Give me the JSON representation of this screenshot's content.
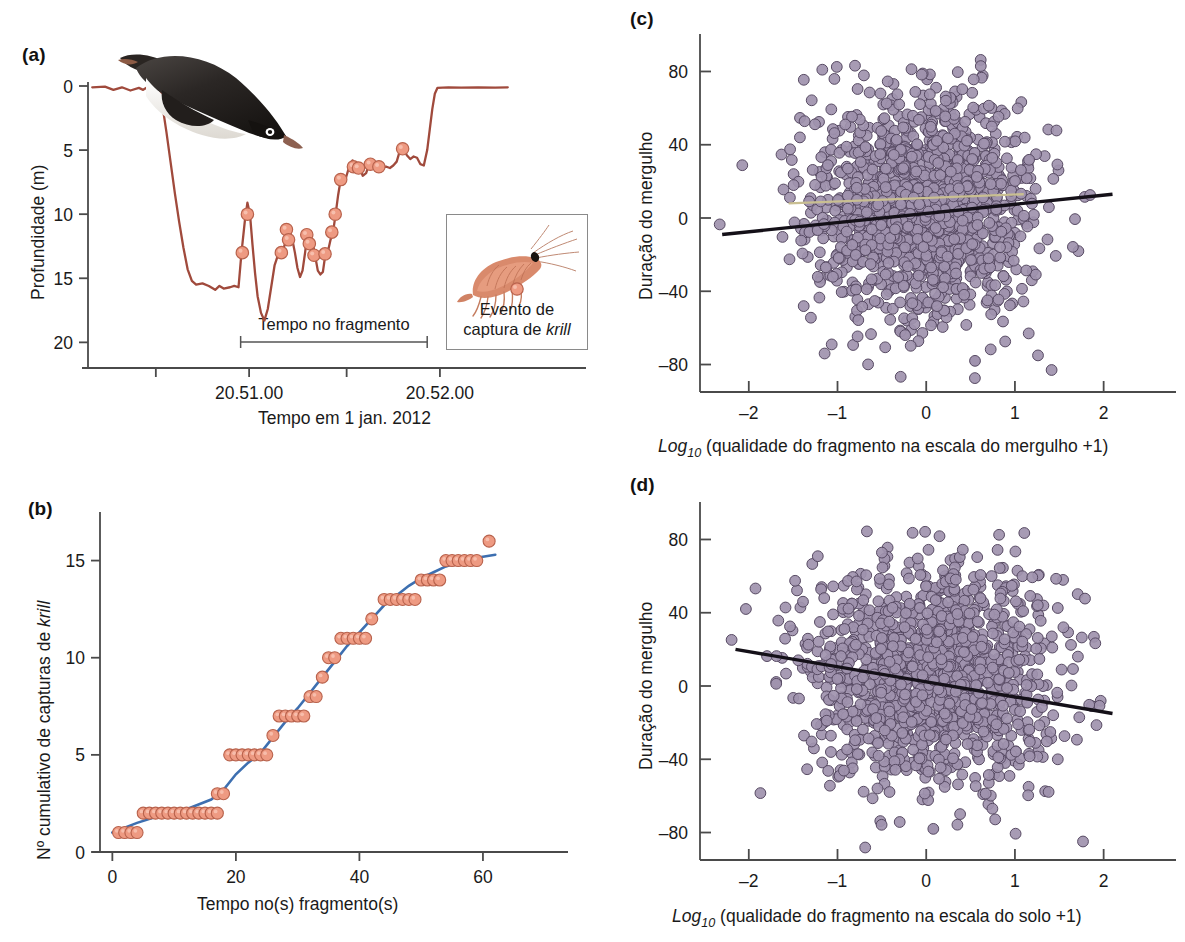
{
  "figure": {
    "panels": [
      "a",
      "b",
      "c",
      "d"
    ],
    "colors": {
      "dive_trace": "#a04a3c",
      "krill_marker_fill": "#ee9a82",
      "krill_marker_edge": "#b8624c",
      "fit_curve_blue": "#3d6fb0",
      "scatter_fill": "#a093ae",
      "scatter_edge": "#574a63",
      "regression_line": "#141018",
      "axis": "#4a4a4a",
      "text": "#1a1a1a"
    }
  },
  "panel_a": {
    "label": "(a)",
    "ylabel": "Profundidade (m)",
    "xlabel": "Tempo em 1 jan. 2012",
    "bracket_label": "Tempo no fragmento",
    "yticks": [
      0,
      5,
      10,
      15,
      20
    ],
    "xticks": [
      "",
      "20.51.00",
      "",
      "20.52.00"
    ],
    "legend": {
      "line1": "Evento de",
      "line2_prefix": "captura de ",
      "line2_italic": "krill",
      "marker": "krill-capture-dot",
      "icon": "krill-illustration"
    },
    "animal_icon": "penguin-illustration"
  },
  "panel_b": {
    "label": "(b)",
    "ylabel_prefix": "Nº cumulativo de capturas de ",
    "ylabel_italic": "krill",
    "xlabel": "Tempo no(s) fragmento(s)",
    "yticks": [
      0,
      5,
      10,
      15
    ],
    "xticks": [
      0,
      20,
      40,
      60
    ]
  },
  "panel_c": {
    "label": "(c)",
    "ylabel": "Duração do mergulho",
    "xlabel_prefix": "Log",
    "xlabel_sub": "10",
    "xlabel_rest": " (qualidade do fragmento na escala do mergulho +1)",
    "yticks": [
      "80",
      "40",
      "0",
      "–40",
      "–80"
    ],
    "xticks": [
      "–2",
      "–1",
      "0",
      "1",
      "2"
    ]
  },
  "panel_d": {
    "label": "(d)",
    "ylabel": "Duração do mergulho",
    "xlabel_prefix": "Log",
    "xlabel_sub": "10",
    "xlabel_rest": " (qualidade do fragmento na escala do solo +1)",
    "yticks": [
      "80",
      "40",
      "0",
      "–40",
      "–80"
    ],
    "xticks": [
      "–2",
      "–1",
      "0",
      "1",
      "2"
    ]
  },
  "chart_data": [
    {
      "panel": "a",
      "type": "line",
      "title": "",
      "xlabel": "Tempo em 1 jan. 2012",
      "ylabel": "Profundidade (m)",
      "ylim": [
        0,
        22
      ],
      "y_inverted": true,
      "xlim": [
        0,
        100
      ],
      "xtick_positions": [
        16,
        38,
        61,
        83
      ],
      "xtick_labels": [
        "",
        "20.51.00",
        "",
        "20.52.00"
      ],
      "ytick_values": [
        0,
        5,
        10,
        15,
        20
      ],
      "grid": false,
      "bracket": {
        "label": "Tempo no fragmento",
        "x_start": 36,
        "x_end": 80
      },
      "dive_profile": [
        [
          1,
          0.1
        ],
        [
          4,
          0.05
        ],
        [
          6,
          0.3
        ],
        [
          8,
          0.1
        ],
        [
          10,
          0.35
        ],
        [
          12,
          0.15
        ],
        [
          13,
          0.3
        ],
        [
          14,
          0.1
        ],
        [
          15,
          0.25
        ],
        [
          16,
          0.1
        ],
        [
          16.5,
          0.2
        ],
        [
          17,
          0.1
        ],
        [
          17.5,
          1.4
        ],
        [
          18.5,
          3.6
        ],
        [
          19.5,
          6.0
        ],
        [
          20.5,
          8.4
        ],
        [
          21.5,
          10.6
        ],
        [
          22.5,
          12.6
        ],
        [
          23.5,
          14.3
        ],
        [
          24.5,
          15.2
        ],
        [
          25.5,
          15.5
        ],
        [
          27,
          15.4
        ],
        [
          28.5,
          15.6
        ],
        [
          30,
          15.9
        ],
        [
          31,
          15.6
        ],
        [
          32,
          15.8
        ],
        [
          33.5,
          15.7
        ],
        [
          34.5,
          15.6
        ],
        [
          35.5,
          15.7
        ],
        [
          36.2,
          13.0
        ],
        [
          37,
          10.5
        ],
        [
          37.6,
          9.1
        ],
        [
          38.2,
          10.0
        ],
        [
          38.8,
          12.4
        ],
        [
          39.4,
          14.6
        ],
        [
          40,
          16.4
        ],
        [
          40.8,
          17.7
        ],
        [
          41.6,
          18.3
        ],
        [
          42.4,
          17.4
        ],
        [
          43.2,
          15.7
        ],
        [
          44,
          14.0
        ],
        [
          44.8,
          13.2
        ],
        [
          45.6,
          13.0
        ],
        [
          46.4,
          12.4
        ],
        [
          47,
          11.0
        ],
        [
          47.6,
          11.3
        ],
        [
          48.2,
          12.0
        ],
        [
          48.8,
          13.0
        ],
        [
          49.4,
          14.2
        ],
        [
          50,
          14.9
        ],
        [
          50.6,
          14.4
        ],
        [
          51.2,
          13.0
        ],
        [
          51.8,
          11.4
        ],
        [
          52.4,
          11.8
        ],
        [
          53,
          12.2
        ],
        [
          53.6,
          13.3
        ],
        [
          54.2,
          14.4
        ],
        [
          54.8,
          14.7
        ],
        [
          55.4,
          14.5
        ],
        [
          56,
          13.1
        ],
        [
          56.6,
          12.9
        ],
        [
          57.2,
          12.0
        ],
        [
          57.8,
          11.4
        ],
        [
          58.4,
          10.0
        ],
        [
          59,
          8.5
        ],
        [
          59.6,
          7.3
        ],
        [
          60.2,
          7.1
        ],
        [
          60.8,
          7.2
        ],
        [
          61.6,
          6.3
        ],
        [
          62.4,
          5.8
        ],
        [
          63.2,
          6.2
        ],
        [
          64,
          6.3
        ],
        [
          64.8,
          7.0
        ],
        [
          65.6,
          6.8
        ],
        [
          66.4,
          6.0
        ],
        [
          67.2,
          6.2
        ],
        [
          68,
          6.3
        ],
        [
          68.8,
          6.5
        ],
        [
          69.6,
          6.3
        ],
        [
          70.4,
          6.3
        ],
        [
          71.2,
          6.4
        ],
        [
          72,
          6.2
        ],
        [
          72.8,
          5.9
        ],
        [
          73.6,
          5.0
        ],
        [
          74.4,
          4.9
        ],
        [
          75.2,
          5.4
        ],
        [
          76,
          5.7
        ],
        [
          76.8,
          5.5
        ],
        [
          77.6,
          5.6
        ],
        [
          78.4,
          6.1
        ],
        [
          79.2,
          6.2
        ],
        [
          80,
          5.0
        ],
        [
          80.6,
          3.4
        ],
        [
          81.2,
          1.8
        ],
        [
          81.8,
          0.6
        ],
        [
          82.4,
          0.15
        ],
        [
          85,
          0.1
        ],
        [
          88,
          0.12
        ],
        [
          92,
          0.1
        ],
        [
          96,
          0.12
        ],
        [
          99,
          0.1
        ]
      ],
      "krill_events": [
        [
          36.4,
          13.0
        ],
        [
          37.6,
          10.0
        ],
        [
          46.8,
          11.2
        ],
        [
          47.3,
          12.0
        ],
        [
          45.6,
          13.0
        ],
        [
          51.6,
          11.6
        ],
        [
          52.2,
          12.3
        ],
        [
          53.3,
          13.2
        ],
        [
          57.5,
          11.4
        ],
        [
          58.3,
          10.0
        ],
        [
          55.9,
          13.1
        ],
        [
          59.6,
          7.3
        ],
        [
          62.6,
          6.3
        ],
        [
          63.8,
          6.4
        ],
        [
          66.6,
          6.1
        ],
        [
          68.6,
          6.3
        ],
        [
          74.2,
          4.9
        ]
      ]
    },
    {
      "panel": "b",
      "type": "scatter",
      "title": "",
      "xlabel": "Tempo no(s) fragmento(s)",
      "ylabel": "Nº cumulativo de capturas de krill",
      "xlim": [
        -2,
        66
      ],
      "ylim": [
        0,
        17.5
      ],
      "xticks": [
        0,
        20,
        40,
        60
      ],
      "yticks": [
        0,
        5,
        10,
        15
      ],
      "grid": false,
      "points": [
        [
          1,
          1
        ],
        [
          2,
          1
        ],
        [
          3,
          1
        ],
        [
          4,
          1
        ],
        [
          5,
          2
        ],
        [
          6,
          2
        ],
        [
          7,
          2
        ],
        [
          8,
          2
        ],
        [
          9,
          2
        ],
        [
          10,
          2
        ],
        [
          11,
          2
        ],
        [
          12,
          2
        ],
        [
          13,
          2
        ],
        [
          14,
          2
        ],
        [
          15,
          2
        ],
        [
          16,
          2
        ],
        [
          17,
          2
        ],
        [
          17,
          3
        ],
        [
          18,
          3
        ],
        [
          19,
          5
        ],
        [
          20,
          5
        ],
        [
          21,
          5
        ],
        [
          22,
          5
        ],
        [
          23,
          5
        ],
        [
          24,
          5
        ],
        [
          25,
          5
        ],
        [
          26,
          6
        ],
        [
          27,
          7
        ],
        [
          28,
          7
        ],
        [
          29,
          7
        ],
        [
          30,
          7
        ],
        [
          31,
          7
        ],
        [
          32,
          8
        ],
        [
          33,
          8
        ],
        [
          34,
          9
        ],
        [
          35,
          10
        ],
        [
          36,
          10
        ],
        [
          37,
          11
        ],
        [
          38,
          11
        ],
        [
          39,
          11
        ],
        [
          40,
          11
        ],
        [
          41,
          11
        ],
        [
          42,
          12
        ],
        [
          44,
          13
        ],
        [
          45,
          13
        ],
        [
          46,
          13
        ],
        [
          47,
          13
        ],
        [
          48,
          13
        ],
        [
          49,
          13
        ],
        [
          50,
          14
        ],
        [
          51,
          14
        ],
        [
          52,
          14
        ],
        [
          53,
          14
        ],
        [
          54,
          15
        ],
        [
          55,
          15
        ],
        [
          56,
          15
        ],
        [
          57,
          15
        ],
        [
          58,
          15
        ],
        [
          59,
          15
        ],
        [
          61,
          16
        ]
      ],
      "fit_curve": {
        "type": "logistic",
        "color": "#3d6fb0",
        "points": [
          [
            0,
            1.0
          ],
          [
            4,
            1.5
          ],
          [
            8,
            1.9
          ],
          [
            12,
            2.2
          ],
          [
            16,
            2.7
          ],
          [
            18,
            3.2
          ],
          [
            20,
            4.0
          ],
          [
            22,
            4.6
          ],
          [
            24,
            5.1
          ],
          [
            26,
            5.9
          ],
          [
            28,
            6.7
          ],
          [
            30,
            7.4
          ],
          [
            32,
            8.2
          ],
          [
            34,
            9.0
          ],
          [
            36,
            9.8
          ],
          [
            38,
            10.6
          ],
          [
            40,
            11.3
          ],
          [
            42,
            12.0
          ],
          [
            44,
            12.7
          ],
          [
            46,
            13.2
          ],
          [
            48,
            13.7
          ],
          [
            50,
            14.1
          ],
          [
            52,
            14.4
          ],
          [
            54,
            14.7
          ],
          [
            56,
            14.9
          ],
          [
            58,
            15.1
          ],
          [
            60,
            15.2
          ],
          [
            62,
            15.3
          ]
        ]
      }
    },
    {
      "panel": "c",
      "type": "scatter",
      "title": "",
      "xlabel": "Log10 (qualidade do fragmento na escala do mergulho +1)",
      "ylabel": "Duração do mergulho",
      "xlim": [
        -2.55,
        2.5
      ],
      "ylim": [
        -95,
        95
      ],
      "xticks": [
        -2,
        -1,
        0,
        1,
        2
      ],
      "yticks": [
        -80,
        -40,
        0,
        40,
        80
      ],
      "grid": false,
      "n_points": 1450,
      "cluster": {
        "x_mean": -0.05,
        "x_sd": 0.62,
        "y_mean": 5,
        "y_sd": 30
      },
      "regression_line": {
        "x": [
          -2.3,
          2.1
        ],
        "y": [
          -9,
          13
        ],
        "color": "#141018"
      },
      "secondary_line": {
        "x": [
          -1.55,
          1.1
        ],
        "y": [
          8,
          13
        ],
        "color": "#c9bf92",
        "dashed": true
      }
    },
    {
      "panel": "d",
      "type": "scatter",
      "title": "",
      "xlabel": "Log10 (qualidade do fragmento na escala do solo +1)",
      "ylabel": "Duração do mergulho",
      "xlim": [
        -2.55,
        2.5
      ],
      "ylim": [
        -95,
        95
      ],
      "xticks": [
        -2,
        -1,
        0,
        1,
        2
      ],
      "yticks": [
        -80,
        -40,
        0,
        40,
        80
      ],
      "grid": false,
      "n_points": 1400,
      "cluster": {
        "x_mean": 0.05,
        "x_sd": 0.68,
        "y_mean": 5,
        "y_sd": 30
      },
      "regression_line": {
        "x": [
          -2.15,
          2.1
        ],
        "y": [
          20,
          -15
        ],
        "color": "#141018"
      }
    }
  ]
}
